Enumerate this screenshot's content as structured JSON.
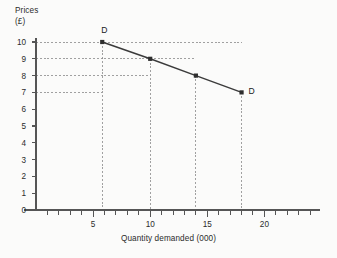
{
  "chart_data": {
    "type": "line",
    "title": "",
    "xlabel": "Quantity demanded (000)",
    "ylabel": "Prices (£)",
    "ylabel_line1": "Prices",
    "ylabel_line2": "(£)",
    "xlim": [
      0,
      25
    ],
    "ylim": [
      0,
      10
    ],
    "grid": "dashed guide lines from each point to both axes",
    "legend_position": "inline end-labels",
    "x": [
      5.8,
      10,
      14,
      18
    ],
    "y": [
      10,
      9,
      8,
      7
    ],
    "series": [
      {
        "name": "D",
        "points": [
          {
            "x": 5.8,
            "y": 10
          },
          {
            "x": 10,
            "y": 9
          },
          {
            "x": 14,
            "y": 8
          },
          {
            "x": 18,
            "y": 7
          }
        ]
      }
    ],
    "annotations": [
      {
        "text": "D",
        "x": 5.8,
        "y": 10,
        "position": "above-left-of-first-point"
      },
      {
        "text": "D",
        "x": 18,
        "y": 7,
        "position": "right-of-last-point"
      }
    ],
    "y_ticks": [
      0,
      1,
      2,
      3,
      4,
      5,
      6,
      7,
      8,
      9,
      10
    ],
    "y_tick_labels": [
      "0",
      "1",
      "2",
      "3",
      "4",
      "5",
      "6",
      "7",
      "8",
      "9",
      "10"
    ],
    "x_ticks_major": [
      5,
      10,
      15,
      20
    ],
    "x_tick_labels": [
      "5",
      "10",
      "15",
      "20"
    ],
    "x_ticks_minor_step": 1,
    "gridline_y_values": [
      7,
      8,
      9,
      10
    ],
    "gridline_x_values": [
      5.8,
      10,
      14,
      18
    ],
    "colors": {
      "line": "#3b3b3b",
      "marker": "#2e2e2e",
      "axis": "#555555",
      "grid": "#8a8a8a",
      "text": "#2b2b2b",
      "background": "#fbfbfa"
    }
  }
}
